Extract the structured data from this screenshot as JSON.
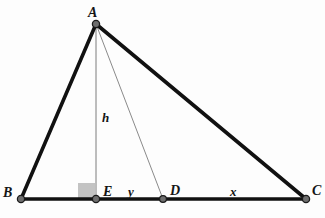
{
  "figure": {
    "type": "geometry-diagram",
    "width": 325,
    "height": 218,
    "background_color": "#fdfdfd"
  },
  "style": {
    "outline_stroke_color": "#111111",
    "outline_stroke_width": 3.6,
    "inner_stroke_color": "#7d7d7d",
    "inner_stroke_width": 1,
    "vertex_fill_color": "#6e6e6e",
    "vertex_edge_color": "#1a1a1a",
    "vertex_radius": 3.6,
    "right_angle_fill_color": "#c3c3c3",
    "label_color": "#151515"
  },
  "points": {
    "A": {
      "label": "A",
      "x": 96,
      "y": 24,
      "label_x": 88,
      "label_y": 6
    },
    "B": {
      "label": "B",
      "x": 21,
      "y": 199,
      "label_x": 3,
      "label_y": 186
    },
    "E": {
      "label": "E",
      "x": 96,
      "y": 199,
      "label_x": 103,
      "label_y": 185
    },
    "D": {
      "label": "D",
      "x": 163,
      "y": 199,
      "label_x": 170,
      "label_y": 184
    },
    "C": {
      "label": "C",
      "x": 306,
      "y": 199,
      "label_x": 312,
      "label_y": 184
    }
  },
  "segments": [
    {
      "name": "side-AB",
      "from": "B",
      "to": "A",
      "weight": "thick"
    },
    {
      "name": "side-AC",
      "from": "A",
      "to": "C",
      "weight": "thick"
    },
    {
      "name": "base-BC",
      "from": "B",
      "to": "C",
      "weight": "thick"
    },
    {
      "name": "altitude-AE",
      "from": "A",
      "to": "E",
      "weight": "thin"
    },
    {
      "name": "cevian-AD",
      "from": "A",
      "to": "D",
      "weight": "thin"
    }
  ],
  "measures": {
    "height": {
      "label": "h",
      "x": 102,
      "y": 111,
      "segment": "altitude-AE"
    },
    "y": {
      "label": "y",
      "x": 128,
      "y": 185,
      "segment": "ED"
    },
    "x": {
      "label": "x",
      "x": 230,
      "y": 185,
      "segment": "DC"
    }
  },
  "right_angle": {
    "name": "right-angle-marker-at-E",
    "x": 78,
    "y": 183,
    "width": 17,
    "height": 16
  }
}
